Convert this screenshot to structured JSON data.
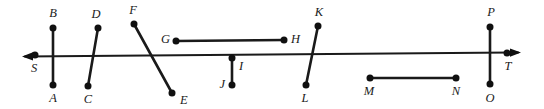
{
  "figure": {
    "kind": "geometry-diagram",
    "width": 544,
    "height": 109,
    "background_color": "#ffffff",
    "stroke_color": "#1a1a1a",
    "dot_color": "#101010"
  },
  "main_line": {
    "name": "line ST",
    "x1": 22,
    "y1": 56.5,
    "x2": 521,
    "y2": 52.5,
    "left_arrow": true,
    "right_arrow": true
  },
  "segments": [
    {
      "id": "AB",
      "from": "B",
      "to": "A",
      "x1": 53,
      "y1": 28,
      "x2": 53,
      "y2": 85
    },
    {
      "id": "CD",
      "from": "D",
      "to": "C",
      "x1": 98,
      "y1": 28,
      "x2": 88,
      "y2": 86
    },
    {
      "id": "EF",
      "from": "F",
      "to": "E",
      "x1": 134,
      "y1": 24,
      "x2": 172,
      "y2": 93
    },
    {
      "id": "GH",
      "from": "G",
      "to": "H",
      "x1": 176,
      "y1": 41,
      "x2": 284,
      "y2": 40
    },
    {
      "id": "IJ",
      "from": "I",
      "to": "J",
      "x1": 232,
      "y1": 58,
      "x2": 232,
      "y2": 85
    },
    {
      "id": "KL",
      "from": "K",
      "to": "L",
      "x1": 318,
      "y1": 26,
      "x2": 306,
      "y2": 85
    },
    {
      "id": "MN",
      "from": "M",
      "to": "N",
      "x1": 370,
      "y1": 78,
      "x2": 456,
      "y2": 78
    },
    {
      "id": "OP",
      "from": "P",
      "to": "O",
      "x1": 490,
      "y1": 27,
      "x2": 490,
      "y2": 84
    }
  ],
  "points": [
    {
      "label": "A",
      "x": 53,
      "y": 85,
      "lx": 53,
      "ly": 99,
      "anchor": "middle"
    },
    {
      "label": "B",
      "x": 53,
      "y": 28,
      "lx": 53,
      "ly": 14,
      "anchor": "middle"
    },
    {
      "label": "C",
      "x": 88,
      "y": 86,
      "lx": 88,
      "ly": 100,
      "anchor": "middle"
    },
    {
      "label": "D",
      "x": 98,
      "y": 28,
      "lx": 96,
      "ly": 15,
      "anchor": "middle"
    },
    {
      "label": "E",
      "x": 172,
      "y": 93,
      "lx": 180,
      "ly": 101,
      "anchor": "start"
    },
    {
      "label": "F",
      "x": 134,
      "y": 24,
      "lx": 133,
      "ly": 11,
      "anchor": "middle"
    },
    {
      "label": "G",
      "x": 176,
      "y": 41,
      "lx": 170,
      "ly": 40,
      "anchor": "end"
    },
    {
      "label": "H",
      "x": 284,
      "y": 40,
      "lx": 291,
      "ly": 40,
      "anchor": "start"
    },
    {
      "label": "I",
      "x": 232,
      "y": 58,
      "lx": 239,
      "ly": 67,
      "anchor": "start"
    },
    {
      "label": "J",
      "x": 232,
      "y": 85,
      "lx": 225,
      "ly": 85,
      "anchor": "end"
    },
    {
      "label": "K",
      "x": 318,
      "y": 26,
      "lx": 319,
      "ly": 13,
      "anchor": "middle"
    },
    {
      "label": "L",
      "x": 306,
      "y": 85,
      "lx": 305,
      "ly": 99,
      "anchor": "middle"
    },
    {
      "label": "M",
      "x": 370,
      "y": 78,
      "lx": 369,
      "ly": 92,
      "anchor": "middle"
    },
    {
      "label": "N",
      "x": 456,
      "y": 78,
      "lx": 456,
      "ly": 92,
      "anchor": "middle"
    },
    {
      "label": "O",
      "x": 490,
      "y": 84,
      "lx": 490,
      "ly": 99,
      "anchor": "middle"
    },
    {
      "label": "P",
      "x": 490,
      "y": 27,
      "lx": 491,
      "ly": 13,
      "anchor": "middle"
    },
    {
      "label": "S",
      "x": 35,
      "y": 55,
      "lx": 34,
      "ly": 69,
      "anchor": "middle"
    },
    {
      "label": "T",
      "x": 507,
      "y": 53,
      "lx": 508,
      "ly": 67,
      "anchor": "middle"
    }
  ]
}
